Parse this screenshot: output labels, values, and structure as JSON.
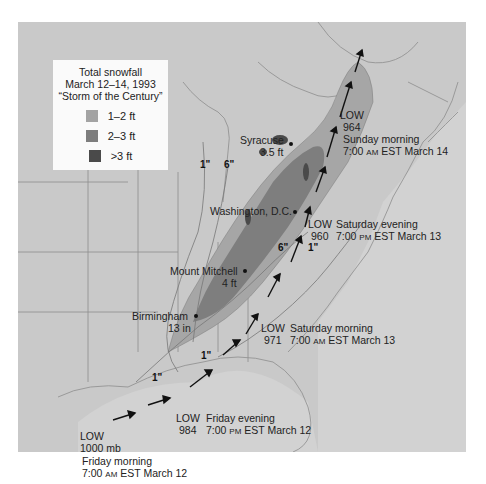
{
  "legend": {
    "title_line1": "Total snowfall",
    "title_line2": "March 12–14, 1993",
    "title_line3": "“Storm of the Century”",
    "items": [
      {
        "label": "1–2 ft",
        "color": "#a3a3a3"
      },
      {
        "label": "2–3 ft",
        "color": "#7d7d7d"
      },
      {
        "label": ">3 ft",
        "color": "#4a4a4a"
      }
    ]
  },
  "cities": [
    {
      "name": "Syracuse",
      "value": "3.5 ft"
    },
    {
      "name": "Washington, D.C.",
      "value": ""
    },
    {
      "name": "Mount Mitchell",
      "value": "4 ft"
    },
    {
      "name": "Birmingham",
      "value": "13 in"
    }
  ],
  "isolines": [
    "1\"",
    "6\"",
    "6\"",
    "1\"",
    "1\"",
    "1\""
  ],
  "storm_track": [
    {
      "label": "LOW",
      "pressure": "1000 mb",
      "day": "Friday morning",
      "time": "7:00",
      "ampm": "AM",
      "rest": "EST March 12"
    },
    {
      "label": "LOW",
      "pressure": "984",
      "day": "Friday evening",
      "time": "7:00",
      "ampm": "PM",
      "rest": "EST March 12"
    },
    {
      "label": "LOW",
      "pressure": "971",
      "day": "Saturday morning",
      "time": "7:00",
      "ampm": "AM",
      "rest": "EST March 13"
    },
    {
      "label": "LOW",
      "pressure": "960",
      "day": "Saturday evening",
      "time": "7:00",
      "ampm": "PM",
      "rest": "EST March 13"
    },
    {
      "label": "LOW",
      "pressure": "964",
      "day": "Sunday morning",
      "time": "7:00",
      "ampm": "AM",
      "rest": "EST March 14"
    }
  ],
  "colors": {
    "land": "#c9c9c9",
    "water": "#d6d6d6",
    "border": "#8a8a8a"
  }
}
